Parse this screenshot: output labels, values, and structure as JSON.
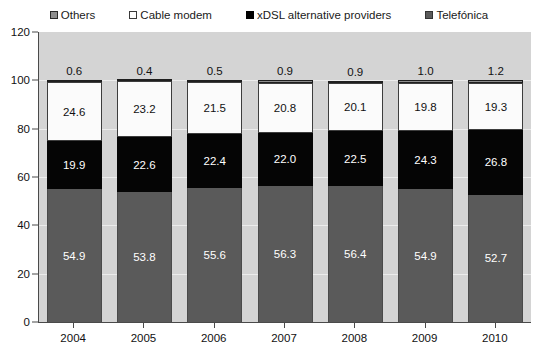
{
  "chart_data": {
    "type": "bar",
    "subtype": "stacked-100-percent",
    "title": "",
    "xlabel": "",
    "ylabel": "",
    "ylim": [
      0,
      120
    ],
    "yticks": [
      0,
      20,
      40,
      60,
      80,
      100,
      120
    ],
    "grid": true,
    "legend_position": "top",
    "categories": [
      "2004",
      "2005",
      "2006",
      "2007",
      "2008",
      "2009",
      "2010"
    ],
    "series": [
      {
        "name": "Telefónica",
        "color": "#5a5a5a",
        "values": [
          54.9,
          53.8,
          55.6,
          56.3,
          56.4,
          54.9,
          52.7
        ],
        "labels": [
          "54.9",
          "53.8",
          "55.6",
          "56.3",
          "56.4",
          "54.9",
          "52.7"
        ]
      },
      {
        "name": "xDSL alternative providers",
        "color": "#050505",
        "values": [
          19.9,
          22.6,
          22.4,
          22.0,
          22.5,
          24.3,
          26.8
        ],
        "labels": [
          "19.9",
          "22.6",
          "22.4",
          "22.0",
          "22.5",
          "24.3",
          "26.8"
        ]
      },
      {
        "name": "Cable modem",
        "color": "#fbfbfb",
        "values": [
          24.6,
          23.2,
          21.5,
          20.8,
          20.1,
          19.8,
          19.3
        ],
        "labels": [
          "24.6",
          "23.2",
          "21.5",
          "20.8",
          "20.1",
          "19.8",
          "19.3"
        ]
      },
      {
        "name": "Others",
        "color": "#8d8d8d",
        "values": [
          0.6,
          0.4,
          0.5,
          0.9,
          0.9,
          1.0,
          1.2
        ],
        "labels": [
          "0.6",
          "0.4",
          "0.5",
          "0.9",
          "0.9",
          "1.0",
          "1.2"
        ]
      }
    ]
  },
  "legend": {
    "items": [
      {
        "label": "Others",
        "swatch": "others-swatch-icon"
      },
      {
        "label": "Cable modem",
        "swatch": "cable-modem-swatch-icon"
      },
      {
        "label": "xDSL alternative providers",
        "swatch": "xdsl-swatch-icon"
      },
      {
        "label": "Telefónica",
        "swatch": "telefonica-swatch-icon"
      }
    ]
  },
  "axes": {
    "y_ticks": [
      "0",
      "20",
      "40",
      "60",
      "80",
      "100",
      "120"
    ],
    "x_labels": [
      "2004",
      "2005",
      "2006",
      "2007",
      "2008",
      "2009",
      "2010"
    ]
  },
  "colors": {
    "plot_background": "#d4d4d4",
    "page_background": "#ffffff",
    "axis": "#4a4a4a",
    "telefonica": "#5a5a5a",
    "xdsl": "#050505",
    "cable_modem": "#fbfbfb",
    "others": "#8d8d8d",
    "label_light": "#ffffff",
    "label_dark": "#111111"
  }
}
